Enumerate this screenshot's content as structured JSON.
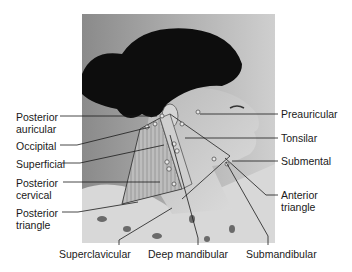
{
  "figure": {
    "left_labels": [
      {
        "id": "posterior-auricular",
        "lines": [
          "Posterior",
          "auricular"
        ],
        "x": 16,
        "y": 111
      },
      {
        "id": "occipital",
        "lines": [
          "Occipital"
        ],
        "x": 16,
        "y": 141
      },
      {
        "id": "superficial",
        "lines": [
          "Superficial"
        ],
        "x": 16,
        "y": 160
      },
      {
        "id": "posterior-cervical",
        "lines": [
          "Posterior",
          "cervical"
        ],
        "x": 16,
        "y": 178
      },
      {
        "id": "posterior-triangle",
        "lines": [
          "Posterior",
          "triangle"
        ],
        "x": 16,
        "y": 208
      }
    ],
    "right_labels": [
      {
        "id": "preauricular",
        "lines": [
          "Preauricular"
        ],
        "x": 281,
        "y": 108
      },
      {
        "id": "tonsilar",
        "lines": [
          "Tonsilar"
        ],
        "x": 281,
        "y": 131
      },
      {
        "id": "submental",
        "lines": [
          "Submental"
        ],
        "x": 281,
        "y": 155
      },
      {
        "id": "anterior-triangle",
        "lines": [
          "Anterior",
          "triangle"
        ],
        "x": 281,
        "y": 186
      }
    ],
    "bottom_labels": [
      {
        "id": "superclavicular",
        "lines": [
          "Superclavicular"
        ],
        "x": 59,
        "y": 248
      },
      {
        "id": "deep-mandibular",
        "lines": [
          "Deep mandibular"
        ],
        "x": 148,
        "y": 248
      },
      {
        "id": "submandibular",
        "lines": [
          "Submandibular"
        ],
        "x": 246,
        "y": 248
      }
    ],
    "colors": {
      "leader_line": "#1a1a1a",
      "photo_background": "#9a9a9a",
      "hair": "#0d0d0d",
      "skin": "#c9c9c9",
      "node": "#e8e8e8"
    }
  }
}
